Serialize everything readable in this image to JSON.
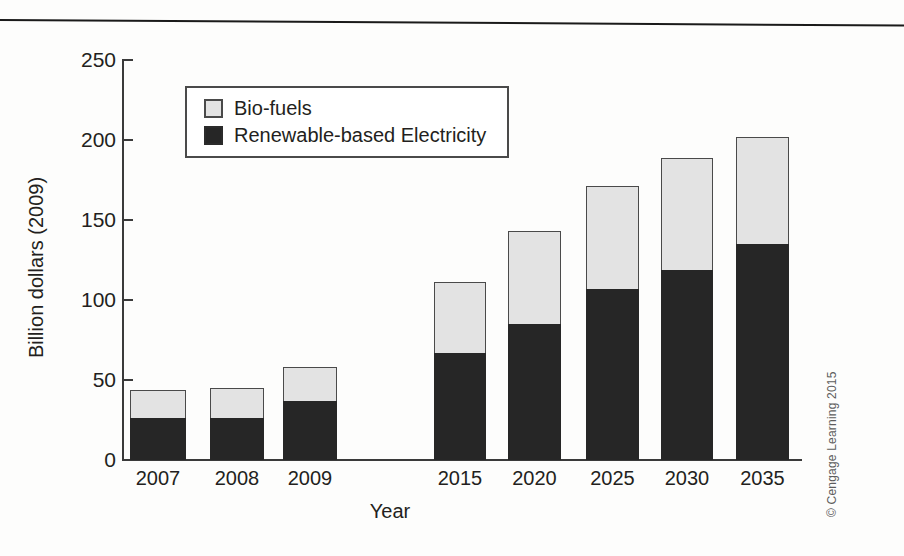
{
  "figure": {
    "credit": "© Cengage Learning 2015",
    "top_rule": "horizontal-rule"
  },
  "legend": {
    "items": [
      {
        "label": "Bio-fuels",
        "color": "#e3e3e3",
        "swatch": "light-square-icon"
      },
      {
        "label": "Renewable-based Electricity",
        "color": "#262626",
        "swatch": "dark-square-icon"
      }
    ]
  },
  "axis": {
    "y_title": "Billion dollars (2009)",
    "x_title": "Year",
    "y_ticks": [
      "0",
      "50",
      "100",
      "150",
      "200",
      "250"
    ]
  },
  "chart_data": {
    "type": "bar",
    "subtype": "stacked",
    "title": "",
    "xlabel": "Year",
    "ylabel": "Billion dollars (2009)",
    "ylim": [
      0,
      250
    ],
    "ytick_values": [
      0,
      50,
      100,
      150,
      200,
      250
    ],
    "grid": false,
    "legend_position": "upper-left-inside",
    "categories": [
      "2007",
      "2008",
      "2009",
      "2015",
      "2020",
      "2025",
      "2030",
      "2035"
    ],
    "series": [
      {
        "name": "Renewable-based Electricity",
        "color": "#262626",
        "values": [
          26,
          26,
          37,
          67,
          85,
          107,
          119,
          135
        ]
      },
      {
        "name": "Bio-fuels",
        "color": "#e3e3e3",
        "values": [
          18,
          19,
          21,
          44,
          58,
          64,
          70,
          67
        ]
      }
    ],
    "totals": [
      44,
      45,
      58,
      111,
      143,
      171,
      189,
      202
    ]
  },
  "layout": {
    "baseline_y": 460,
    "axis_x": 122,
    "px_per_unit": 1.6,
    "bars": [
      {
        "category": "2007",
        "x": 130,
        "width": 56
      },
      {
        "category": "2008",
        "x": 210,
        "width": 54
      },
      {
        "category": "2009",
        "x": 283,
        "width": 54
      },
      {
        "category": "2015",
        "x": 434,
        "width": 52
      },
      {
        "category": "2020",
        "x": 508,
        "width": 53
      },
      {
        "category": "2025",
        "x": 586,
        "width": 53
      },
      {
        "category": "2030",
        "x": 661,
        "width": 52
      },
      {
        "category": "2035",
        "x": 736,
        "width": 53
      }
    ]
  }
}
